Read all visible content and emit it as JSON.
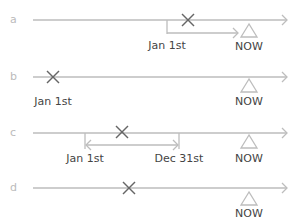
{
  "colors": {
    "line": "#bdbdbd",
    "marker": "#666666",
    "letter": "#bbbbbb",
    "text": "#444444"
  },
  "rows": [
    {
      "letter": "a",
      "labels": {
        "start": "Jan 1st",
        "now": "NOW"
      }
    },
    {
      "letter": "b",
      "labels": {
        "start": "Jan 1st",
        "now": "NOW"
      }
    },
    {
      "letter": "c",
      "labels": {
        "start": "Jan 1st",
        "end": "Dec 31st",
        "now": "NOW"
      }
    },
    {
      "letter": "d",
      "labels": {
        "now": "NOW"
      }
    }
  ]
}
